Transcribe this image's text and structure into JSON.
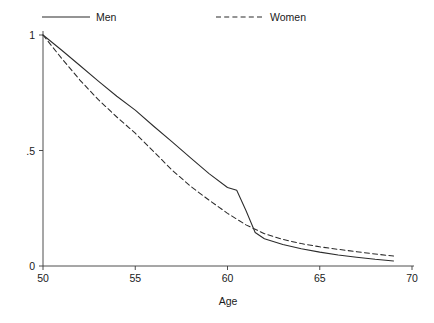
{
  "chart_data": {
    "type": "line",
    "title": "",
    "subtitle": "",
    "xlabel": "Age",
    "ylabel": "",
    "xlim": [
      50,
      70
    ],
    "ylim": [
      0,
      1
    ],
    "grid": false,
    "legend_position": "top",
    "x_ticks": [
      "50",
      "55",
      "60",
      "65",
      "70"
    ],
    "x_tick_values": [
      50,
      55,
      60,
      65,
      70
    ],
    "y_ticks": [
      "0",
      ".5",
      "1"
    ],
    "y_tick_values": [
      0,
      0.5,
      1
    ],
    "series": [
      {
        "name": "Men",
        "style": "solid",
        "color": "#2b2b2b",
        "x": [
          50,
          51,
          52,
          53,
          54,
          55,
          56,
          57,
          58,
          59,
          60,
          60.5,
          61,
          61.5,
          62,
          63,
          64,
          65,
          66,
          67,
          68,
          69
        ],
        "values": [
          1.0,
          0.935,
          0.868,
          0.8,
          0.735,
          0.675,
          0.605,
          0.537,
          0.468,
          0.4,
          0.34,
          0.328,
          0.24,
          0.145,
          0.118,
          0.093,
          0.075,
          0.06,
          0.048,
          0.038,
          0.029,
          0.022
        ]
      },
      {
        "name": "Women",
        "style": "dashed",
        "color": "#2b2b2b",
        "x": [
          50,
          51,
          52,
          53,
          54,
          55,
          56,
          57,
          58,
          59,
          60,
          61,
          62,
          63,
          64,
          65,
          66,
          67,
          68,
          69
        ],
        "values": [
          1.0,
          0.9,
          0.805,
          0.72,
          0.645,
          0.575,
          0.495,
          0.415,
          0.345,
          0.285,
          0.228,
          0.178,
          0.14,
          0.115,
          0.097,
          0.083,
          0.072,
          0.062,
          0.052,
          0.043
        ]
      }
    ]
  },
  "legend": {
    "entries": [
      {
        "label": "Men",
        "style": "solid"
      },
      {
        "label": "Women",
        "style": "dashed"
      }
    ]
  },
  "axes": {
    "x_title": "Age",
    "y_title": ""
  }
}
